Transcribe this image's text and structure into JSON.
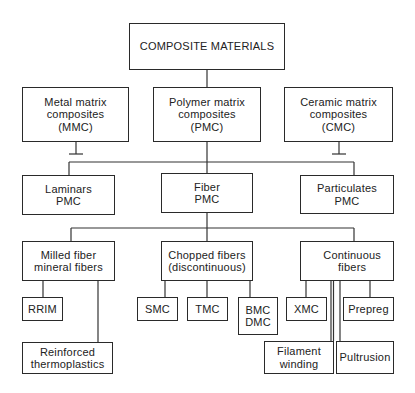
{
  "diagram": {
    "type": "hierarchy",
    "root": "COMPOSITE MATERIALS",
    "level1": [
      {
        "id": "mmc",
        "label": "Metal matrix\ncomposites\n(MMC)"
      },
      {
        "id": "pmc",
        "label": "Polymer matrix\ncomposites\n(PMC)"
      },
      {
        "id": "cmc",
        "label": "Ceramic matrix\ncomposites\n(CMC)"
      }
    ],
    "level2": [
      {
        "id": "laminars",
        "label": "Laminars\nPMC"
      },
      {
        "id": "fiber",
        "label": "Fiber\nPMC"
      },
      {
        "id": "particulates",
        "label": "Particulates\nPMC"
      }
    ],
    "level3": [
      {
        "id": "milled",
        "label": "Milled fiber\nmineral fibers"
      },
      {
        "id": "chopped",
        "label": "Chopped fibers\n(discontinuous)"
      },
      {
        "id": "continuous",
        "label": "Continuous\nfibers"
      }
    ],
    "level4": [
      {
        "id": "rrim",
        "label": "RRIM",
        "parent": "milled"
      },
      {
        "id": "reinforced",
        "label": "Reinforced\nthermoplastics",
        "parent": "milled"
      },
      {
        "id": "smc",
        "label": "SMC",
        "parent": "chopped"
      },
      {
        "id": "tmc",
        "label": "TMC",
        "parent": "chopped"
      },
      {
        "id": "bmc",
        "label": "BMC\nDMC",
        "parent": "chopped"
      },
      {
        "id": "xmc",
        "label": "XMC",
        "parent": "continuous"
      },
      {
        "id": "filament",
        "label": "Filament\nwinding",
        "parent": "continuous"
      },
      {
        "id": "pultrusion",
        "label": "Pultrusion",
        "parent": "continuous"
      },
      {
        "id": "prepreg",
        "label": "Prepreg",
        "parent": "continuous"
      }
    ],
    "colors": {
      "stroke": "#2a2a2a",
      "background": "#ffffff",
      "text": "#222222"
    }
  }
}
